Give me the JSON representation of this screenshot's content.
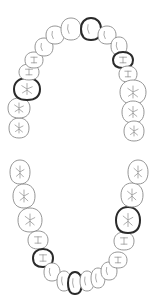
{
  "diagram": {
    "type": "dental-chart",
    "colors": {
      "outline": "#8a8a8a",
      "selected_outline": "#2a2a2a",
      "background": "#ffffff"
    },
    "upper_arch": [
      {
        "id": "U1",
        "cx": 19,
        "cy": 128,
        "rx": 10,
        "ry": 10,
        "kind": "molar",
        "selected": false
      },
      {
        "id": "U2",
        "cx": 19,
        "cy": 108,
        "rx": 11,
        "ry": 10,
        "kind": "molar",
        "selected": false
      },
      {
        "id": "U3",
        "cx": 27,
        "cy": 89,
        "rx": 13,
        "ry": 11,
        "kind": "molar",
        "selected": true
      },
      {
        "id": "U4",
        "cx": 29,
        "cy": 72,
        "rx": 10,
        "ry": 8,
        "kind": "premolar",
        "selected": false
      },
      {
        "id": "U5",
        "cx": 34,
        "cy": 60,
        "rx": 9,
        "ry": 8,
        "kind": "premolar",
        "selected": false
      },
      {
        "id": "U6",
        "cx": 44,
        "cy": 47,
        "rx": 9,
        "ry": 9,
        "kind": "canine",
        "selected": false
      },
      {
        "id": "U7",
        "cx": 55,
        "cy": 35,
        "rx": 9,
        "ry": 9,
        "kind": "incisor",
        "selected": false
      },
      {
        "id": "U8",
        "cx": 71,
        "cy": 29,
        "rx": 10,
        "ry": 11,
        "kind": "incisor",
        "selected": false
      },
      {
        "id": "U9",
        "cx": 91,
        "cy": 29,
        "rx": 10,
        "ry": 11,
        "kind": "incisor",
        "selected": true
      },
      {
        "id": "U10",
        "cx": 107,
        "cy": 35,
        "rx": 9,
        "ry": 9,
        "kind": "incisor",
        "selected": false
      },
      {
        "id": "U11",
        "cx": 119,
        "cy": 46,
        "rx": 8,
        "ry": 9,
        "kind": "canine",
        "selected": false
      },
      {
        "id": "U12",
        "cx": 123,
        "cy": 60,
        "rx": 10,
        "ry": 8,
        "kind": "premolar",
        "selected": true
      },
      {
        "id": "U13",
        "cx": 128,
        "cy": 74,
        "rx": 9,
        "ry": 8,
        "kind": "premolar",
        "selected": false
      },
      {
        "id": "U14",
        "cx": 133,
        "cy": 92,
        "rx": 13,
        "ry": 12,
        "kind": "molar",
        "selected": false
      },
      {
        "id": "U15",
        "cx": 133,
        "cy": 112,
        "rx": 11,
        "ry": 11,
        "kind": "molar",
        "selected": false
      },
      {
        "id": "U16",
        "cx": 134,
        "cy": 131,
        "rx": 10,
        "ry": 10,
        "kind": "molar",
        "selected": false
      }
    ],
    "lower_arch": [
      {
        "id": "L1",
        "cx": 20,
        "cy": 172,
        "rx": 10,
        "ry": 12,
        "kind": "molar",
        "selected": false
      },
      {
        "id": "L2",
        "cx": 24,
        "cy": 196,
        "rx": 11,
        "ry": 12,
        "kind": "molar",
        "selected": false
      },
      {
        "id": "L3",
        "cx": 30,
        "cy": 220,
        "rx": 12,
        "ry": 12,
        "kind": "molar",
        "selected": false
      },
      {
        "id": "L4",
        "cx": 38,
        "cy": 240,
        "rx": 10,
        "ry": 9,
        "kind": "premolar",
        "selected": false
      },
      {
        "id": "L5",
        "cx": 43,
        "cy": 258,
        "rx": 10,
        "ry": 9,
        "kind": "premolar",
        "selected": true
      },
      {
        "id": "L6",
        "cx": 52,
        "cy": 272,
        "rx": 8,
        "ry": 9,
        "kind": "canine",
        "selected": false
      },
      {
        "id": "L7",
        "cx": 64,
        "cy": 281,
        "rx": 7,
        "ry": 10,
        "kind": "incisor",
        "selected": false
      },
      {
        "id": "L8",
        "cx": 75,
        "cy": 283,
        "rx": 7,
        "ry": 11,
        "kind": "incisor",
        "selected": true
      },
      {
        "id": "L9",
        "cx": 87,
        "cy": 281,
        "rx": 7,
        "ry": 10,
        "kind": "incisor",
        "selected": false
      },
      {
        "id": "L10",
        "cx": 98,
        "cy": 278,
        "rx": 7,
        "ry": 10,
        "kind": "incisor",
        "selected": false
      },
      {
        "id": "L11",
        "cx": 109,
        "cy": 271,
        "rx": 8,
        "ry": 9,
        "kind": "canine",
        "selected": false
      },
      {
        "id": "L12",
        "cx": 118,
        "cy": 260,
        "rx": 9,
        "ry": 8,
        "kind": "premolar",
        "selected": false
      },
      {
        "id": "L13",
        "cx": 124,
        "cy": 241,
        "rx": 10,
        "ry": 9,
        "kind": "premolar",
        "selected": false
      },
      {
        "id": "L14",
        "cx": 128,
        "cy": 220,
        "rx": 12,
        "ry": 13,
        "kind": "molar",
        "selected": true
      },
      {
        "id": "L15",
        "cx": 132,
        "cy": 195,
        "rx": 11,
        "ry": 12,
        "kind": "molar",
        "selected": false
      },
      {
        "id": "L16",
        "cx": 138,
        "cy": 172,
        "rx": 10,
        "ry": 12,
        "kind": "molar",
        "selected": false
      }
    ]
  }
}
